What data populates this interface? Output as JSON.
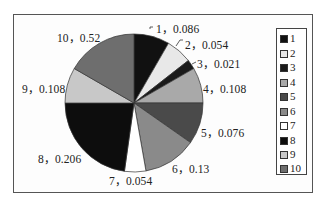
{
  "chart_data": {
    "type": "pie",
    "title": "",
    "categories": [
      "1",
      "2",
      "3",
      "4",
      "5",
      "6",
      "7",
      "8",
      "9",
      "10"
    ],
    "values": [
      0.086,
      0.054,
      0.021,
      0.108,
      0.076,
      0.13,
      0.054,
      0.206,
      0.108,
      0.52
    ],
    "data_labels": [
      "1，0.086",
      "2，0.054",
      "3，0.021",
      "4，0.108",
      "5，0.076",
      "6，0.13",
      "7，0.054",
      "8，0.206",
      "9，0.108",
      "10，0.52"
    ],
    "slice_colors": [
      "#111111",
      "#e8e8e8",
      "#1a1a1a",
      "#a9a9a9",
      "#4a4a4a",
      "#8a8a8a",
      "#ffffff",
      "#0d0d0d",
      "#c8c8c8",
      "#6e6e6e"
    ],
    "visual_angles_deg": [
      [
        0,
        30
      ],
      [
        30,
        52
      ],
      [
        52,
        60
      ],
      [
        60,
        90
      ],
      [
        90,
        125
      ],
      [
        125,
        170
      ],
      [
        170,
        188
      ],
      [
        188,
        270
      ],
      [
        270,
        300
      ],
      [
        300,
        360
      ]
    ],
    "legend": {
      "position": "right",
      "entries": [
        "1",
        "2",
        "3",
        "4",
        "5",
        "6",
        "7",
        "8",
        "9",
        "10"
      ]
    }
  },
  "labels": {
    "l1": "1，0.086",
    "l2": "2，0.054",
    "l3": "3，0.021",
    "l4": "4，0.108",
    "l5": "5，0.076",
    "l6": "6，0.13",
    "l7": "7，0.054",
    "l8": "8，0.206",
    "l9": "9，0.108",
    "l10": "10，0.52"
  },
  "legend": {
    "items": [
      "1",
      "2",
      "3",
      "4",
      "5",
      "6",
      "7",
      "8",
      "9",
      "10"
    ]
  }
}
